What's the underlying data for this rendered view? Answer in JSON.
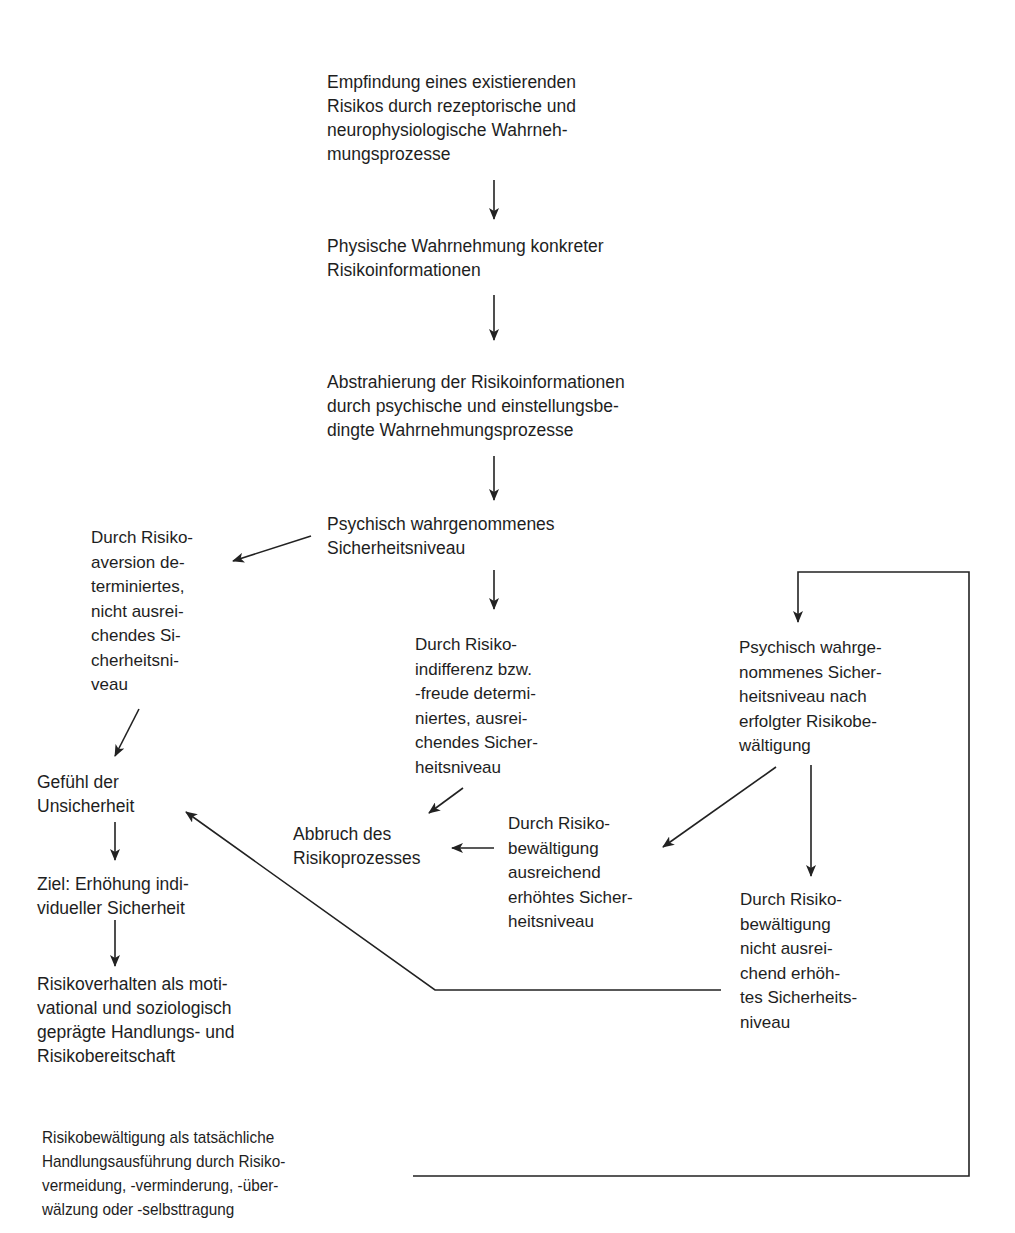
{
  "diagram": {
    "type": "flowchart",
    "language": "de",
    "colors": {
      "text": "#1e1e1e",
      "line": "#222222",
      "background": "#ffffff"
    },
    "nodes": [
      {
        "id": "n1",
        "text": "Empfindung eines existierenden\nRisikos durch rezeptorische und\nneurophysiologische Wahrneh-\nmungsprozesse"
      },
      {
        "id": "n2",
        "text": "Physische Wahrnehmung konkreter\nRisikoinformationen"
      },
      {
        "id": "n3",
        "text": "Abstrahierung der Risikoinformationen\ndurch psychische und einstellungsbe-\ndingte Wahrnehmungsprozesse"
      },
      {
        "id": "n4",
        "text": "Psychisch wahrgenommenes\nSicherheitsniveau"
      },
      {
        "id": "n5",
        "text": "Durch Risiko-\naversion de-\nterminiertes,\nnicht ausrei-\nchendes Si-\ncherheitsni-\nveau"
      },
      {
        "id": "n6",
        "text": "Durch Risiko-\nindifferenz bzw.\n-freude determi-\nniertes, ausrei-\nchendes Sicher-\nheitsniveau"
      },
      {
        "id": "n7",
        "text": "Psychisch wahrge-\nnommenes Sicher-\nheitsniveau nach\nerfolgter Risikobe-\nwältigung"
      },
      {
        "id": "n8",
        "text": "Gefühl der\nUnsicherheit"
      },
      {
        "id": "n9",
        "text": "Abbruch des\nRisikoprozesses"
      },
      {
        "id": "n10",
        "text": "Durch Risiko-\nbewältigung\nausreichend\nerhöhtes Sicher-\nheitsniveau"
      },
      {
        "id": "n11",
        "text": "Ziel: Erhöhung indi-\nvidueller Sicherheit"
      },
      {
        "id": "n12",
        "text": "Durch Risiko-\nbewältigung\nnicht ausrei-\nchend erhöh-\ntes Sicherheits-\nniveau"
      },
      {
        "id": "n13",
        "text": "Risikoverhalten als moti-\nvational und soziologisch\ngeprägte Handlungs- und\nRisikobereitschaft"
      },
      {
        "id": "n14",
        "text": "Risikobewältigung als tatsächliche\nHandlungsausführung durch Risiko-\nvermeidung, -verminderung, -über-\nwälzung oder -selbsttragung"
      }
    ],
    "edges": [
      {
        "from": "n1",
        "to": "n2"
      },
      {
        "from": "n2",
        "to": "n3"
      },
      {
        "from": "n3",
        "to": "n4"
      },
      {
        "from": "n4",
        "to": "n5"
      },
      {
        "from": "n4",
        "to": "n6"
      },
      {
        "from": "n5",
        "to": "n8"
      },
      {
        "from": "n6",
        "to": "n9"
      },
      {
        "from": "n8",
        "to": "n11"
      },
      {
        "from": "n11",
        "to": "n13"
      },
      {
        "from": "n10",
        "to": "n9"
      },
      {
        "from": "n7",
        "to": "n10"
      },
      {
        "from": "n7",
        "to": "n12"
      },
      {
        "from": "n12",
        "to": "n8"
      },
      {
        "from": "n14",
        "to": "n7"
      }
    ]
  }
}
